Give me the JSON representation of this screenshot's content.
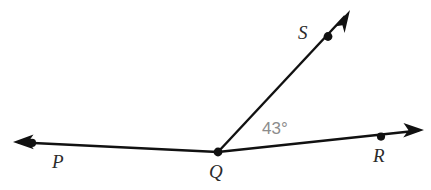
{
  "diagram": {
    "type": "angle-diagram",
    "background_color": "#ffffff",
    "stroke_color": "#111111",
    "label_color": "#2b2b2b",
    "angle_label_color": "#8c8c8c",
    "points": [
      {
        "id": "P",
        "label": "P",
        "x": 32,
        "y": 143,
        "label_x": 52,
        "label_y": 168
      },
      {
        "id": "Q",
        "label": "Q",
        "x": 218,
        "y": 152,
        "label_x": 209,
        "label_y": 178
      },
      {
        "id": "R",
        "label": "R",
        "x": 381,
        "y": 136,
        "label_x": 373,
        "label_y": 162
      },
      {
        "id": "S",
        "label": "S",
        "x": 328,
        "y": 36,
        "label_x": 298,
        "label_y": 39
      }
    ],
    "rays": [
      {
        "id": "ray-QP",
        "from": "Q",
        "through": "P",
        "tip_x": 13,
        "tip_y": 142,
        "arrow": true
      },
      {
        "id": "ray-QR",
        "from": "Q",
        "through": "R",
        "tip_x": 424,
        "tip_y": 130,
        "arrow": true
      },
      {
        "id": "ray-QS",
        "from": "Q",
        "through": "S",
        "tip_x": 350,
        "tip_y": 10,
        "arrow": true
      }
    ],
    "angles": [
      {
        "id": "angle-SQR",
        "vertex": "Q",
        "arms": [
          "S",
          "R"
        ],
        "measure": "43°",
        "value": 43,
        "unit": "degrees",
        "label_x": 262,
        "label_y": 134
      }
    ]
  }
}
